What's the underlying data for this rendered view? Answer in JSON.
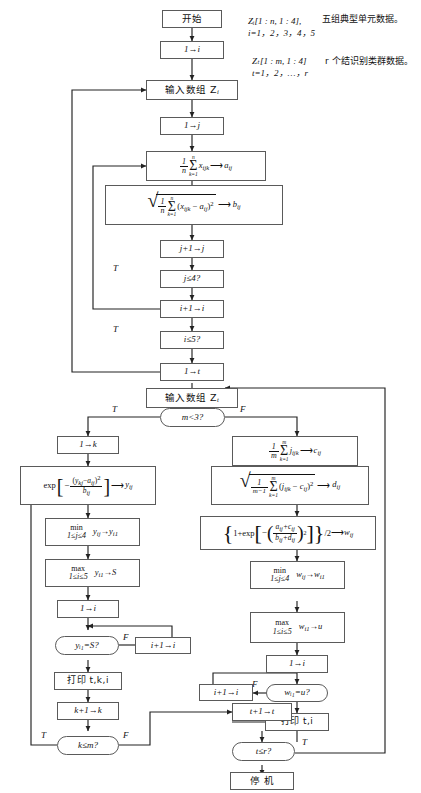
{
  "notes": [
    {
      "id": "note-zi",
      "line1": "Zᵢ[1 : n, 1 : 4],",
      "line2": "i=1，2，3，4，5",
      "desc": "五组典型单元数据。"
    },
    {
      "id": "note-zt",
      "line1": "Zₜ[1 : m, 1 : 4]",
      "line2": "t=1，2，…，r",
      "desc": "r 个结识别类群数据。"
    }
  ],
  "nodes": {
    "start": "开始",
    "init_i": "1→i",
    "input_zi": "输入数组 Z",
    "input_zi_sub": "i",
    "init_j": "1→j",
    "calc_a": "(1/n)Σ(k=1..n) xᵢⱼₖ ⟶ aᵢⱼ",
    "calc_b": "√[(1/n)Σ(k=1..n)(xᵢⱼₖ − aᵢⱼ)²] ⟶ bᵢⱼ",
    "inc_j": "j+1→j",
    "test_j": "j≤4?",
    "inc_i1": "i+1→i",
    "test_i1": "i≤5?",
    "init_t": "1→t",
    "input_zt": "输入数组 Z",
    "input_zt_sub": "t",
    "test_m": "m<3?",
    "init_k": "1→k",
    "calc_y": "exp[−(yₖⱼ − aᵢⱼ)² / bᵢⱼ] ⟶ yᵢⱼ",
    "min_y": "min 1≤j≤4   yᵢⱼ→yᵢ₁",
    "max_y": "max 1≤i≤5   yᵢ₁→S",
    "init_i2": "1→i",
    "test_y": "yᵢ₁=S?",
    "inc_i2": "i+1→i",
    "print_tki": "打印 t,k,i",
    "inc_k": "k+1→k",
    "test_k": "k≤m?",
    "calc_c": "(1/m)Σ(k=1..m) jᵢⱼₖ ⟶ cᵢⱼ",
    "calc_d": "√[(1/(m−1))Σ(k=1..m)(jᵢⱼₖ − cᵢⱼ)²] ⟶ dᵢⱼ",
    "calc_w": "{1+exp[−((aᵢⱼ+cᵢⱼ)/(bᵢⱼ+dᵢⱼ))²]}/2 ⟶ wᵢⱼ",
    "min_w": "min 1≤j≤4   wᵢⱼ→wᵢ₁",
    "max_w": "max 1≤i≤5   wᵢ₁→u",
    "init_i3": "1→i",
    "test_w": "wᵢ₁=u?",
    "inc_i3": "i+1→i",
    "print_ti": "打印 t,i",
    "inc_t": "t+1→t",
    "test_t": "t≤r?",
    "stop": "停 机"
  },
  "branch_labels": {
    "test_j_true": "T",
    "test_i1_true": "T",
    "test_m_true": "T",
    "test_m_false": "F",
    "test_y_false": "F",
    "test_k_true": "T",
    "test_k_false": "F",
    "test_w_false": "F",
    "test_t_true": "T"
  },
  "math_parts": {
    "one": "1",
    "n": "n",
    "m": "m",
    "m_minus_1": "m−1",
    "sum_top_n": "n",
    "sum_top_m": "m",
    "sum_bot": "k=1",
    "sigma": "Σ",
    "arrow": "⟶",
    "min": "min",
    "max": "max",
    "range_j": "1≤j≤4",
    "range_i": "1≤i≤5",
    "exp": "exp"
  },
  "colors": {
    "stroke": "#5a5a5a",
    "line": "#222222",
    "text": "#111111",
    "background": "#ffffff"
  }
}
